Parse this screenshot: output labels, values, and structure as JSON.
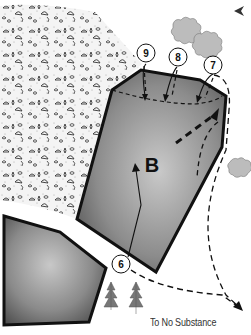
{
  "diagram": {
    "area_label": "B",
    "markers": [
      {
        "id": "9",
        "label": "9",
        "cx": 146,
        "cy": 55
      },
      {
        "id": "8",
        "label": "8",
        "cx": 178,
        "cy": 58
      },
      {
        "id": "7",
        "label": "7",
        "cx": 213,
        "cy": 65
      },
      {
        "id": "6",
        "label": "6",
        "cx": 121,
        "cy": 264
      }
    ],
    "caption": "To No Substance",
    "compass_icon": "arrowhead-left",
    "colors": {
      "outline": "#111111",
      "fill_dark": "#5a5a5a",
      "fill_light": "#c4c4c4",
      "bush": "#bdbdbd",
      "texture_dots": "#8a8a8a"
    }
  }
}
